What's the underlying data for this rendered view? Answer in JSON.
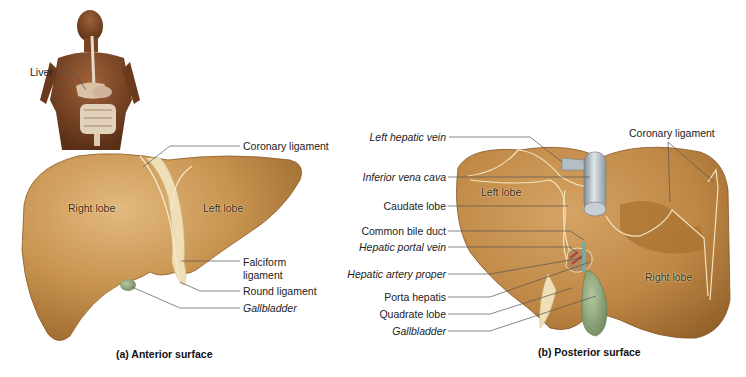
{
  "figure": {
    "inset": {
      "label": "Liver"
    },
    "panel_a": {
      "caption": "(a) Anterior surface",
      "organ_labels": {
        "right_lobe": "Right lobe",
        "left_lobe": "Left lobe"
      },
      "callouts": [
        {
          "text": "Coronary ligament",
          "italic": false
        },
        {
          "text": "Falciform",
          "italic": false
        },
        {
          "text": "ligament",
          "italic": false
        },
        {
          "text": "Round ligament",
          "italic": false
        },
        {
          "text": "Gallbladder",
          "italic": true
        }
      ]
    },
    "panel_b": {
      "caption": "(b) Posterior surface",
      "organ_labels": {
        "left_lobe": "Left lobe",
        "right_lobe": "Right lobe"
      },
      "callouts_left": [
        {
          "text": "Left hepatic vein",
          "italic": true
        },
        {
          "text": "Inferior vena cava",
          "italic": true
        },
        {
          "text": "Caudate lobe",
          "italic": false
        },
        {
          "text": "Common bile duct",
          "italic": false
        },
        {
          "text": "Hepatic portal vein",
          "italic": true
        },
        {
          "text": "Hepatic artery proper",
          "italic": true
        },
        {
          "text": "Porta hepatis",
          "italic": false
        },
        {
          "text": "Quadrate lobe",
          "italic": false
        },
        {
          "text": "Gallbladder",
          "italic": true
        }
      ],
      "callouts_right": [
        {
          "text": "Coronary ligament",
          "italic": false
        }
      ]
    },
    "colors": {
      "liver": "#c8934f",
      "liver_light": "#ddb277",
      "liver_dark": "#9c6a2e",
      "gallbladder": "#8fa77a",
      "ivc": "#a9b4bd",
      "ligament": "#f1e3c0",
      "leader_line": "#555555"
    }
  }
}
